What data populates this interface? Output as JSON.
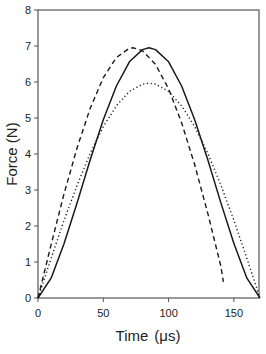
{
  "chart_data": {
    "type": "line",
    "title": "",
    "xlabel": "Time (μs)",
    "ylabel": "Force (N)",
    "xlim": [
      0,
      170
    ],
    "ylim": [
      0,
      8
    ],
    "xticks": [
      0,
      50,
      100,
      150
    ],
    "yticks": [
      0,
      1,
      2,
      3,
      4,
      5,
      6,
      7,
      8
    ],
    "grid": false,
    "legend": null,
    "series": [
      {
        "name": "solid",
        "style": "solid",
        "x": [
          0,
          10,
          20,
          30,
          40,
          50,
          60,
          70,
          80,
          85,
          90,
          100,
          110,
          120,
          130,
          140,
          150,
          160,
          170
        ],
        "y": [
          0,
          0.55,
          1.51,
          2.65,
          3.84,
          4.95,
          5.89,
          6.56,
          6.9,
          6.95,
          6.9,
          6.56,
          5.89,
          4.95,
          3.84,
          2.65,
          1.51,
          0.55,
          0
        ]
      },
      {
        "name": "dashed",
        "style": "dashed",
        "x": [
          0,
          10,
          20,
          30,
          40,
          50,
          60,
          70,
          73,
          80,
          90,
          100,
          110,
          120,
          130,
          140,
          142
        ],
        "y": [
          0,
          1.48,
          2.9,
          4.18,
          5.27,
          6.12,
          6.68,
          6.94,
          6.95,
          6.87,
          6.49,
          5.81,
          4.87,
          3.7,
          2.35,
          0.89,
          0.45
        ]
      },
      {
        "name": "dotted",
        "style": "dotted",
        "x": [
          0,
          10,
          20,
          30,
          40,
          50,
          60,
          70,
          80,
          85,
          90,
          100,
          110,
          120,
          130,
          140,
          150,
          160,
          170
        ],
        "y": [
          0,
          1.1,
          2.16,
          3.14,
          4.02,
          4.76,
          5.34,
          5.74,
          5.94,
          5.97,
          5.94,
          5.74,
          5.34,
          4.76,
          4.02,
          3.14,
          2.16,
          1.1,
          0
        ]
      }
    ],
    "annotations": []
  },
  "axes": {
    "x_title": "Time",
    "x_unit": "(μs)",
    "y_title": "Force (N)"
  },
  "colors": {
    "line": "#1a1a1a",
    "axis": "#333333"
  }
}
